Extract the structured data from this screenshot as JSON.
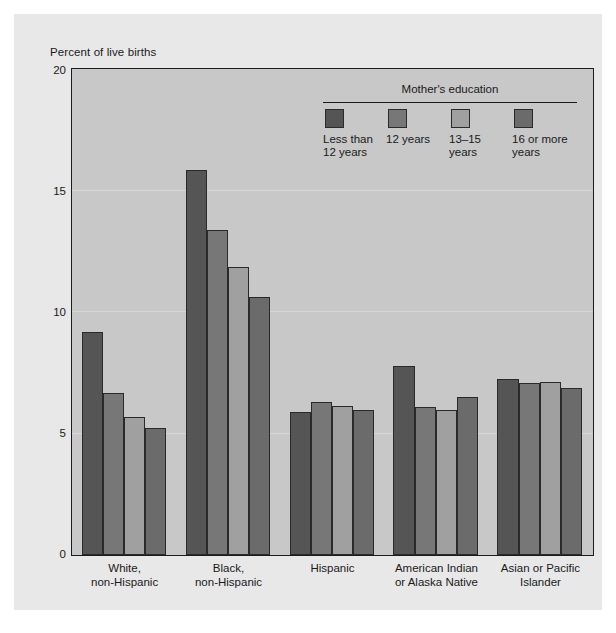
{
  "figure": {
    "y_axis_title": "Percent of live births"
  },
  "legend": {
    "title": "Mother's education",
    "items": [
      {
        "label": "Less than\n12 years",
        "color": "#555555"
      },
      {
        "label": "12 years",
        "color": "#777777"
      },
      {
        "label": "13–15 years",
        "color": "#a0a0a0"
      },
      {
        "label": "16 or more\nyears",
        "color": "#6b6b6b"
      }
    ]
  },
  "chart_data": {
    "type": "bar",
    "title": "",
    "xlabel": "",
    "ylabel": "Percent of live births",
    "ylim": [
      0,
      20
    ],
    "yticks": [
      0,
      5,
      10,
      15,
      20
    ],
    "ytick_labels": [
      "0",
      "5",
      "10",
      "15",
      "20"
    ],
    "grid": false,
    "legend_position": "top-right-inside",
    "categories": [
      "White,\nnon-Hispanic",
      "Black,\nnon-Hispanic",
      "Hispanic",
      "American Indian\nor Alaska Native",
      "Asian or Pacific\nIslander"
    ],
    "series": [
      {
        "name": "Less than 12 years",
        "color": "#555555",
        "values": [
          9.2,
          15.9,
          5.9,
          7.8,
          7.25
        ]
      },
      {
        "name": "12 years",
        "color": "#777777",
        "values": [
          6.7,
          13.4,
          6.3,
          6.1,
          7.1
        ]
      },
      {
        "name": "13–15 years",
        "color": "#a0a0a0",
        "values": [
          5.7,
          11.9,
          6.15,
          6.0,
          7.15
        ]
      },
      {
        "name": "16 or more years",
        "color": "#6b6b6b",
        "values": [
          5.25,
          10.65,
          6.0,
          6.5,
          6.9
        ]
      }
    ]
  }
}
